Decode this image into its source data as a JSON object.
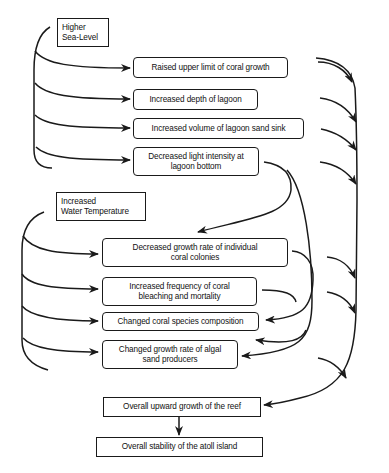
{
  "diagram": {
    "drivers": [
      {
        "id": "sea",
        "label": "Higher\nSea-Level"
      },
      {
        "id": "temp",
        "label": "Increased\nWater Temperature"
      }
    ],
    "sea_effects": [
      {
        "id": "raised",
        "label": "Raised  upper limit of coral growth"
      },
      {
        "id": "depth",
        "label": "Increased depth of lagoon"
      },
      {
        "id": "volume",
        "label": "Increased volume of lagoon sand sink"
      },
      {
        "id": "light",
        "label": "Decreased light intensity at\nlagoon bottom"
      }
    ],
    "temp_effects": [
      {
        "id": "growth",
        "label": "Decreased growth rate of individual\ncoral colonies"
      },
      {
        "id": "bleach",
        "label": "Increased frequency of coral\nbleaching and mortality"
      },
      {
        "id": "species",
        "label": "Changed coral species composition"
      },
      {
        "id": "algal",
        "label": "Changed growth rate of algal\nsand producers"
      }
    ],
    "outcomes": [
      {
        "id": "upward",
        "label": "Overall upward growth of the reef"
      },
      {
        "id": "stability",
        "label": "Overall stability of the atoll island"
      }
    ],
    "colors": {
      "line": "#1a1a1a",
      "background": "#ffffff"
    }
  }
}
